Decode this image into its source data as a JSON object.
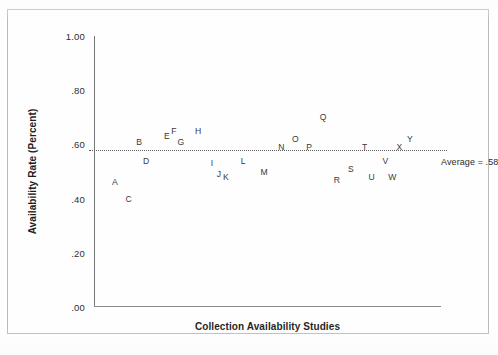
{
  "chart_data": {
    "type": "scatter",
    "title": "",
    "xlabel": "Collection Availability Studies",
    "ylabel": "Availability Rate (Percent)",
    "ylim": [
      0.0,
      1.0
    ],
    "yticks": [
      "1.00",
      ".80",
      ".60",
      ".40",
      ".20",
      ".00"
    ],
    "ytick_values": [
      1.0,
      0.8,
      0.6,
      0.4,
      0.2,
      0.0
    ],
    "grid": false,
    "legend": null,
    "point_label_style": "letter",
    "annotations": [
      {
        "text": "Average = .58",
        "value": 0.58,
        "position": "right-of-line"
      }
    ],
    "reference_line": {
      "label": "Average = .58",
      "value": 0.58,
      "style": "dotted"
    },
    "categories": [
      "A",
      "B",
      "C",
      "D",
      "E",
      "F",
      "G",
      "H",
      "I",
      "J",
      "K",
      "L",
      "M",
      "N",
      "O",
      "P",
      "Q",
      "R",
      "S",
      "T",
      "U",
      "V",
      "W",
      "X",
      "Y"
    ],
    "values": [
      0.46,
      0.61,
      0.4,
      0.54,
      0.63,
      0.65,
      0.61,
      0.65,
      0.53,
      0.49,
      0.48,
      0.54,
      0.5,
      0.59,
      0.62,
      0.59,
      0.7,
      0.47,
      0.51,
      0.59,
      0.48,
      0.54,
      0.48,
      0.59,
      0.62
    ],
    "points": [
      {
        "label": "A",
        "x": 0.06,
        "y": 0.46
      },
      {
        "label": "B",
        "x": 0.13,
        "y": 0.61
      },
      {
        "label": "C",
        "x": 0.1,
        "y": 0.4
      },
      {
        "label": "D",
        "x": 0.15,
        "y": 0.54
      },
      {
        "label": "E",
        "x": 0.21,
        "y": 0.63
      },
      {
        "label": "F",
        "x": 0.23,
        "y": 0.65
      },
      {
        "label": "G",
        "x": 0.25,
        "y": 0.61
      },
      {
        "label": "H",
        "x": 0.3,
        "y": 0.65
      },
      {
        "label": "I",
        "x": 0.34,
        "y": 0.53
      },
      {
        "label": "J",
        "x": 0.36,
        "y": 0.49
      },
      {
        "label": "K",
        "x": 0.38,
        "y": 0.48
      },
      {
        "label": "L",
        "x": 0.43,
        "y": 0.54
      },
      {
        "label": "M",
        "x": 0.49,
        "y": 0.5
      },
      {
        "label": "N",
        "x": 0.54,
        "y": 0.59
      },
      {
        "label": "O",
        "x": 0.58,
        "y": 0.62
      },
      {
        "label": "P",
        "x": 0.62,
        "y": 0.59
      },
      {
        "label": "Q",
        "x": 0.66,
        "y": 0.7
      },
      {
        "label": "R",
        "x": 0.7,
        "y": 0.47
      },
      {
        "label": "S",
        "x": 0.74,
        "y": 0.51
      },
      {
        "label": "T",
        "x": 0.78,
        "y": 0.59
      },
      {
        "label": "U",
        "x": 0.8,
        "y": 0.48
      },
      {
        "label": "V",
        "x": 0.84,
        "y": 0.54
      },
      {
        "label": "W",
        "x": 0.86,
        "y": 0.48
      },
      {
        "label": "X",
        "x": 0.88,
        "y": 0.59
      },
      {
        "label": "Y",
        "x": 0.91,
        "y": 0.62
      }
    ]
  }
}
